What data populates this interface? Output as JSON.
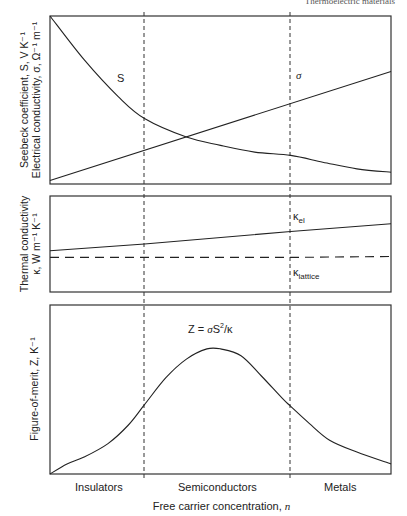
{
  "header": {
    "running_title": "Thermoelectric materials"
  },
  "panels": {
    "top": {
      "ylabel_line1": "Seebeck coefficient, S, V K⁻¹",
      "ylabel_line2": "Electrical conductivity, σ, Ω⁻¹ m⁻¹",
      "label_S": "S",
      "label_sigma": "σ"
    },
    "middle": {
      "ylabel_line1": "Thermal conductivity",
      "ylabel_line2": "κ, W m⁻¹ K⁻¹",
      "label_kel": "κ",
      "label_kel_sub": "el",
      "label_klat": "κ",
      "label_klat_sub": "lattice"
    },
    "bottom": {
      "ylabel": "Figure-of-merit, Z, K⁻¹",
      "formula_prefix": "Z = ",
      "formula_sigma": "σ",
      "formula_S": "S",
      "formula_exp": "2",
      "formula_suffix": "/κ"
    }
  },
  "x_axis": {
    "label": "Free carrier concentration, n",
    "regions": [
      "Insulators",
      "Semiconductors",
      "Metals"
    ]
  },
  "chart_data": [
    {
      "type": "line",
      "title": "Seebeck coefficient and electrical conductivity vs carrier concentration",
      "xlabel": "Free carrier concentration, n",
      "ylabel": "Seebeck coefficient, S, V K^-1 / Electrical conductivity, σ, Ω^-1 m^-1",
      "x_region_boundaries": [
        0.277,
        0.706
      ],
      "x": [
        0,
        0.1,
        0.2,
        0.277,
        0.4,
        0.5,
        0.6,
        0.706,
        0.8,
        0.9,
        1.0
      ],
      "series": [
        {
          "name": "S",
          "values": [
            1.0,
            0.74,
            0.52,
            0.39,
            0.28,
            0.23,
            0.19,
            0.17,
            0.13,
            0.09,
            0.07
          ]
        },
        {
          "name": "σ",
          "values": [
            0.02,
            0.09,
            0.16,
            0.16,
            0.28,
            0.34,
            0.4,
            0.47,
            0.53,
            0.6,
            0.67
          ]
        }
      ],
      "ylim": [
        0,
        1
      ],
      "grid": false,
      "annotations": [
        "S",
        "σ"
      ]
    },
    {
      "type": "line",
      "title": "Thermal conductivity vs carrier concentration",
      "ylabel": "Thermal conductivity κ, W m^-1 K^-1",
      "x": [
        0,
        0.277,
        0.706,
        1.0
      ],
      "series": [
        {
          "name": "κ_el (total)",
          "style": "solid",
          "values": [
            0.43,
            0.5,
            0.63,
            0.71
          ]
        },
        {
          "name": "κ_lattice",
          "style": "dashed",
          "values": [
            0.36,
            0.36,
            0.36,
            0.37
          ]
        }
      ],
      "ylim": [
        0,
        1
      ],
      "grid": false
    },
    {
      "type": "line",
      "title": "Z = σS²/κ",
      "ylabel": "Figure-of-merit, Z, K^-1",
      "xlabel": "Free carrier concentration, n",
      "x": [
        0,
        0.05,
        0.1,
        0.17,
        0.23,
        0.277,
        0.34,
        0.4,
        0.46,
        0.5,
        0.56,
        0.62,
        0.68,
        0.706,
        0.76,
        0.82,
        0.9,
        1.0
      ],
      "series": [
        {
          "name": "Z",
          "values": [
            0.0,
            0.06,
            0.1,
            0.18,
            0.29,
            0.41,
            0.57,
            0.68,
            0.74,
            0.74,
            0.7,
            0.58,
            0.45,
            0.4,
            0.3,
            0.2,
            0.13,
            0.06
          ]
        }
      ],
      "ylim": [
        0,
        1
      ],
      "grid": false,
      "annotations": [
        "Z = σS²/κ"
      ]
    }
  ]
}
